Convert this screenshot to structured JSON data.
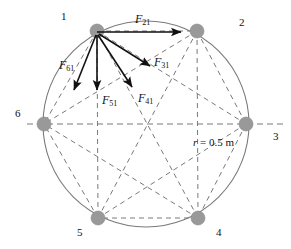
{
  "figure": {
    "geometry": {
      "center": {
        "x": 146,
        "y": 124
      },
      "circle_radius_px": 103,
      "node_radius_px": 7,
      "node_fill": "#999999",
      "line_color": "#7a7a7a",
      "arrow_color": "#111111",
      "background": "#ffffff"
    },
    "radius_annotation": {
      "symbol": "r",
      "equals": "=",
      "value": "0.5",
      "unit": "m",
      "text": "r = 0.5 m",
      "x": 193,
      "y": 137
    },
    "vertices": [
      {
        "id": "1",
        "label": "1",
        "angle_deg": 120,
        "cx": 97,
        "cy": 31,
        "label_x": 61,
        "label_y": 11
      },
      {
        "id": "2",
        "label": "2",
        "angle_deg": 60,
        "cx": 197,
        "cy": 31,
        "label_x": 239,
        "label_y": 17
      },
      {
        "id": "3",
        "label": "3",
        "angle_deg": 0,
        "cx": 246,
        "cy": 124,
        "label_x": 273,
        "label_y": 131
      },
      {
        "id": "4",
        "label": "4",
        "angle_deg": 300,
        "cx": 198,
        "cy": 218,
        "label_x": 216,
        "label_y": 227
      },
      {
        "id": "5",
        "label": "5",
        "angle_deg": 240,
        "cx": 98,
        "cy": 218,
        "label_x": 77,
        "label_y": 227
      },
      {
        "id": "6",
        "label": "6",
        "angle_deg": 180,
        "cx": 44,
        "cy": 124,
        "label_x": 15,
        "label_y": 108
      }
    ],
    "axis_line": {
      "name": "horizontal-dashed-axis",
      "x1": 27,
      "y1": 124,
      "x2": 284,
      "y2": 124
    },
    "chords": [
      {
        "from": "1",
        "to": "2"
      },
      {
        "from": "1",
        "to": "3"
      },
      {
        "from": "1",
        "to": "4"
      },
      {
        "from": "1",
        "to": "5"
      },
      {
        "from": "1",
        "to": "6"
      },
      {
        "from": "2",
        "to": "3"
      },
      {
        "from": "2",
        "to": "4"
      },
      {
        "from": "2",
        "to": "5"
      },
      {
        "from": "2",
        "to": "6"
      },
      {
        "from": "3",
        "to": "4"
      },
      {
        "from": "3",
        "to": "5"
      },
      {
        "from": "3",
        "to": "6"
      },
      {
        "from": "4",
        "to": "5"
      },
      {
        "from": "4",
        "to": "6"
      },
      {
        "from": "5",
        "to": "6"
      }
    ],
    "forces": [
      {
        "id": "F21",
        "symbol": "F",
        "subscript": "21",
        "text": "F21",
        "from": {
          "x": 97,
          "y": 32
        },
        "to": {
          "x": 181,
          "y": 32
        },
        "label_x": 135,
        "label_y": 13
      },
      {
        "id": "F31",
        "symbol": "F",
        "subscript": "31",
        "text": "F31",
        "from": {
          "x": 99,
          "y": 34
        },
        "to": {
          "x": 150,
          "y": 66
        },
        "label_x": 154,
        "label_y": 56
      },
      {
        "id": "F41",
        "symbol": "F",
        "subscript": "41",
        "text": "F41",
        "from": {
          "x": 98,
          "y": 35
        },
        "to": {
          "x": 132,
          "y": 87
        },
        "label_x": 138,
        "label_y": 92
      },
      {
        "id": "F51",
        "symbol": "F",
        "subscript": "51",
        "text": "F51",
        "from": {
          "x": 97,
          "y": 35
        },
        "to": {
          "x": 97,
          "y": 90
        },
        "label_x": 102,
        "label_y": 94
      },
      {
        "id": "F61",
        "symbol": "F",
        "subscript": "61",
        "text": "F61",
        "from": {
          "x": 96,
          "y": 35
        },
        "to": {
          "x": 74,
          "y": 90
        },
        "label_x": 59,
        "label_y": 59
      }
    ]
  }
}
